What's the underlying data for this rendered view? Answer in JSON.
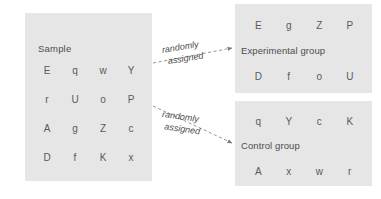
{
  "diagram": {
    "colors": {
      "panel_fill": "#e6e6e6",
      "text": "#555555",
      "connector": "#8c8c8c",
      "background": "#ffffff"
    },
    "sample": {
      "label": "Sample",
      "letters": [
        "E",
        "q",
        "w",
        "Y",
        "r",
        "U",
        "o",
        "P",
        "A",
        "g",
        "Z",
        "c",
        "D",
        "f",
        "K",
        "x"
      ]
    },
    "experimental": {
      "label": "Experimental group",
      "row1": [
        "E",
        "g",
        "Z",
        "P"
      ],
      "row2": [
        "D",
        "f",
        "o",
        "U"
      ]
    },
    "control": {
      "label": "Control group",
      "row1": [
        "q",
        "Y",
        "c",
        "K"
      ],
      "row2": [
        "A",
        "x",
        "w",
        "r"
      ]
    },
    "annotations": {
      "top": {
        "line1": "randomly",
        "line2": "assigned"
      },
      "bottom": {
        "line1": "randomly",
        "line2": "assigned"
      }
    }
  }
}
